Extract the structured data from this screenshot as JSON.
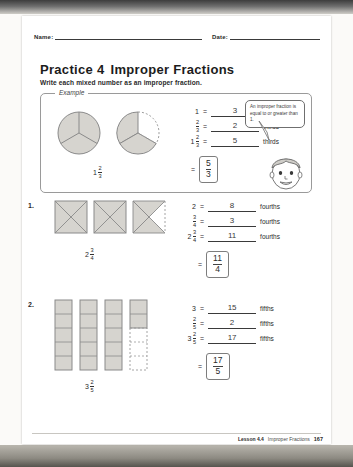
{
  "header": {
    "name_label": "Name:",
    "date_label": "Date:"
  },
  "title": {
    "practice": "Practice",
    "number": "4",
    "topic": "Improper Fractions"
  },
  "instructions": "Write each mixed number as an improper fraction.",
  "example": {
    "label": "Example",
    "diagram_mixed": {
      "whole": "1",
      "num": "2",
      "den": "3"
    },
    "rows": [
      {
        "lhs_whole": "1",
        "lhs_num": "",
        "lhs_den": "",
        "answer": "3",
        "unit": "thirds"
      },
      {
        "lhs_whole": "",
        "lhs_num": "2",
        "lhs_den": "3",
        "answer": "2",
        "unit": "thirds"
      },
      {
        "lhs_whole": "1",
        "lhs_num": "2",
        "lhs_den": "3",
        "answer": "5",
        "unit": "thirds"
      }
    ],
    "final": {
      "equals": "=",
      "num": "5",
      "den": "3"
    },
    "bubble_text": "An improper fraction is equal to or greater than 1."
  },
  "problems": [
    {
      "number": "1.",
      "diagram_mixed": {
        "whole": "2",
        "num": "3",
        "den": "4"
      },
      "shape": "square-fourths",
      "shape_count": 3,
      "partial_parts": 3,
      "parts_per_shape": 4,
      "rows": [
        {
          "lhs_whole": "2",
          "lhs_num": "",
          "lhs_den": "",
          "answer": "8",
          "unit": "fourths"
        },
        {
          "lhs_whole": "",
          "lhs_num": "3",
          "lhs_den": "4",
          "answer": "3",
          "unit": "fourths"
        },
        {
          "lhs_whole": "2",
          "lhs_num": "3",
          "lhs_den": "4",
          "answer": "11",
          "unit": "fourths"
        }
      ],
      "final": {
        "equals": "=",
        "num": "11",
        "den": "4"
      }
    },
    {
      "number": "2.",
      "diagram_mixed": {
        "whole": "3",
        "num": "2",
        "den": "5"
      },
      "shape": "bar-fifths",
      "shape_count": 4,
      "partial_parts": 2,
      "parts_per_shape": 5,
      "rows": [
        {
          "lhs_whole": "3",
          "lhs_num": "",
          "lhs_den": "",
          "answer": "15",
          "unit": "fifths"
        },
        {
          "lhs_whole": "",
          "lhs_num": "2",
          "lhs_den": "5",
          "answer": "2",
          "unit": "fifths"
        },
        {
          "lhs_whole": "3",
          "lhs_num": "2",
          "lhs_den": "5",
          "answer": "17",
          "unit": "fifths"
        }
      ],
      "final": {
        "equals": "=",
        "num": "17",
        "den": "5"
      }
    }
  ],
  "footer": {
    "lesson": "Lesson 4.4",
    "topic": "Improper Fractions",
    "page": "167"
  },
  "colors": {
    "shade": "#d6d4cf",
    "ink": "#2a2a2a",
    "rule": "#3a3a3a"
  }
}
